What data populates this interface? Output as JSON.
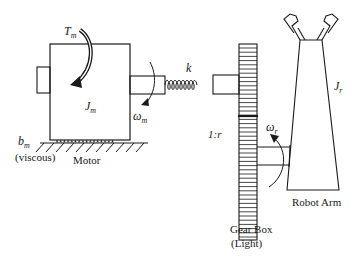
{
  "diagram": {
    "labels": {
      "motor_torque": "T",
      "motor_torque_sub": "m",
      "motor_inertia": "J",
      "motor_inertia_sub": "m",
      "motor_speed": "ω",
      "motor_speed_sub": "m",
      "spring": "k",
      "damping": "b",
      "damping_sub": "m",
      "damping_type": "(viscous)",
      "motor": "Motor",
      "gear_ratio": "1:r",
      "arm_speed": "ω",
      "arm_speed_sub": "r",
      "arm_inertia": "J",
      "arm_inertia_sub": "r",
      "robot_arm": "Robot Arm",
      "gearbox_line1": "Gear Box",
      "gearbox_line2": "(Light)"
    },
    "components": [
      "motor",
      "shaft-spring",
      "gear-box",
      "robot-arm",
      "ground-viscous-friction"
    ],
    "colors": {
      "stroke": "#1a1a1a",
      "background": "#ffffff"
    }
  }
}
